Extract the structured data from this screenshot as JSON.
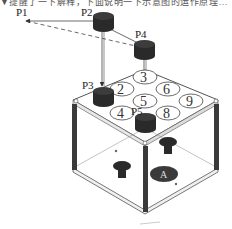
{
  "caption": "▼提醒了一下解释，下面说明一下示意图的运作原理…",
  "labels": {
    "p1": "P1",
    "p2": "P2",
    "p3": "P3",
    "p4": "P4",
    "p5": "P5"
  },
  "keypad": {
    "keys": [
      "3",
      "2",
      "6",
      "5",
      "9",
      "4",
      "8"
    ]
  },
  "base_symbol": "A",
  "colors": {
    "line": "#444444",
    "cap": "#2a2a2a",
    "box_edge": "#555555",
    "post": "#3a3a3a"
  }
}
